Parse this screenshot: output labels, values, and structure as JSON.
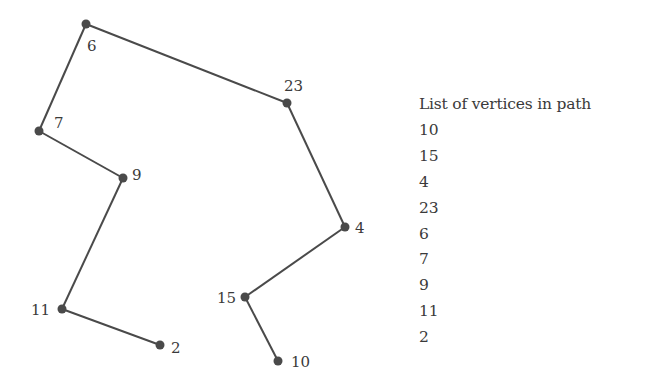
{
  "diagram": {
    "type": "path-graph",
    "edge_color": "#4a4a4a",
    "node_color": "#4a4a4a",
    "vertices": [
      {
        "id": "6",
        "x": 86,
        "y": 24,
        "lx": 87,
        "ly": 51,
        "anchor": "start"
      },
      {
        "id": "23",
        "x": 287,
        "y": 103,
        "lx": 284,
        "ly": 91,
        "anchor": "start"
      },
      {
        "id": "7",
        "x": 39,
        "y": 131,
        "lx": 54,
        "ly": 128,
        "anchor": "start"
      },
      {
        "id": "9",
        "x": 123,
        "y": 178,
        "lx": 132,
        "ly": 180,
        "anchor": "start"
      },
      {
        "id": "4",
        "x": 345,
        "y": 227,
        "lx": 355,
        "ly": 233,
        "anchor": "start"
      },
      {
        "id": "15",
        "x": 245,
        "y": 297,
        "lx": 236,
        "ly": 303,
        "anchor": "end"
      },
      {
        "id": "11",
        "x": 62,
        "y": 309,
        "lx": 50,
        "ly": 315,
        "anchor": "end"
      },
      {
        "id": "2",
        "x": 160,
        "y": 345,
        "lx": 171,
        "ly": 353,
        "anchor": "start"
      },
      {
        "id": "10",
        "x": 278,
        "y": 361,
        "lx": 291,
        "ly": 367,
        "anchor": "start"
      }
    ],
    "path_order": [
      "10",
      "15",
      "4",
      "23",
      "6",
      "7",
      "9",
      "11",
      "2"
    ]
  },
  "legend": {
    "title": "List of vertices in path",
    "items": [
      "10",
      "15",
      "4",
      "23",
      "6",
      "7",
      "9",
      "11",
      "2"
    ]
  }
}
